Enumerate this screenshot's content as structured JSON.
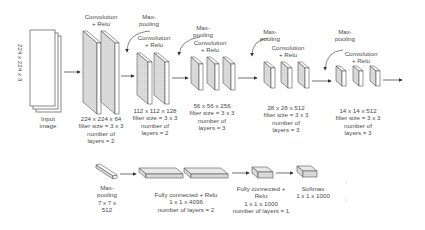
{
  "input": {
    "dimension_label": "224 x 224 x 3",
    "label_line1": "Input",
    "label_line2": "image"
  },
  "blocks": [
    {
      "op_line1": "Convolution",
      "op_line2": "+ Relu",
      "size": "224 x 224 x 64",
      "filter": "filter size = 3 x 3",
      "layers_line1": "number of",
      "layers_line2": "layers = 2"
    },
    {
      "pool_line1": "Max-",
      "pool_line2": "pooling",
      "op_line1": "Convolution",
      "op_line2": "+ Relu",
      "size": "112 x 112 x 128",
      "filter": "filter size = 3 x 3",
      "layers_line1": "number of",
      "layers_line2": "layers = 2"
    },
    {
      "pool_line1": "Max-",
      "pool_line2": "pooling",
      "op_line1": "Convolution",
      "op_line2": "+ Relu",
      "size": "56 x 56 x 256",
      "filter": "filter size = 3 x 3",
      "layers_line1": "number of",
      "layers_line2": "layers = 3"
    },
    {
      "pool_line1": "Max-",
      "pool_line2": "pooling",
      "op_line1": "Convolution",
      "op_line2": "+ Relu",
      "size": "28 x 28 x 512",
      "filter": "filter size = 3 x 3",
      "layers_line1": "number of",
      "layers_line2": "layers = 3"
    },
    {
      "pool_line1": "Max-",
      "pool_line2": "pooling",
      "op_line1": "Convolution",
      "op_line2": "+ Relu",
      "size": "14 x 14 x 512",
      "filter": "filter size = 3 x 3",
      "layers_line1": "number of",
      "layers_line2": "layers = 3"
    }
  ],
  "bottom": {
    "maxpool": {
      "line1": "Max-",
      "line2": "pooling",
      "line3": "7 x 7 x",
      "line4": "512"
    },
    "fc1": {
      "line1": "Fully connected + Relu",
      "line2": "1 x 1 x 4096",
      "line3": "number of layers = 2"
    },
    "fc2": {
      "line1": "Fully connected +",
      "line2": "Relu",
      "line3": "1 x 1 x 1000",
      "line4": "number of layers = 1"
    },
    "softmax": {
      "line1": "Softmax",
      "line2": "1 x 1 x 1000"
    }
  },
  "colors": {
    "stroke": "#4a4a4a",
    "face_gray": "#d9d9d9",
    "face_white": "#ffffff",
    "text": "#4a4a4a"
  }
}
